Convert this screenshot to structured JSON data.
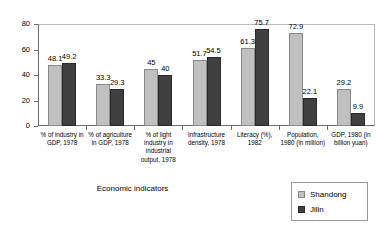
{
  "chart_data": {
    "type": "bar",
    "title": "",
    "subtitle": "",
    "xlabel": "Economic indicators",
    "ylabel": "",
    "ylim": [
      0,
      80
    ],
    "yticks": [
      0,
      20,
      40,
      60,
      80
    ],
    "ytick_labels": [
      "0",
      "20",
      "40",
      "60",
      "80"
    ],
    "grid": false,
    "legend_position": "bottom-right",
    "categories": [
      "% of industry in GDP, 1978",
      "% of agriculture in GDP, 1978",
      "% of light industry in industrial output, 1978",
      "Infrastructure density, 1978",
      "Literacy (%), 1982",
      "Population, 1980 (in million)",
      "GDP, 1980 (in billion yuan)"
    ],
    "series": [
      {
        "name": "Shandong",
        "color": "#c0c0c0",
        "values": [
          48.1,
          33.3,
          45,
          51.7,
          61.3,
          72.9,
          29.2
        ],
        "value_labels": [
          "48.1",
          "33.3",
          "45",
          "51.7",
          "61.3",
          "72.9",
          "29.2"
        ]
      },
      {
        "name": "Jilin",
        "color": "#404040",
        "values": [
          49.2,
          29.3,
          40,
          54.5,
          75.7,
          22.1,
          9.9
        ],
        "value_labels": [
          "49.2",
          "29.3",
          "40",
          "54.5",
          "75.7",
          "22.1",
          "9.9"
        ]
      }
    ]
  },
  "legend": {
    "items": [
      {
        "label": "Shandong",
        "swatch": "legend-swatch-shandong"
      },
      {
        "label": "Jilin",
        "swatch": "legend-swatch-jilin"
      }
    ]
  },
  "axis": {
    "x_title": "Economic indicators"
  }
}
